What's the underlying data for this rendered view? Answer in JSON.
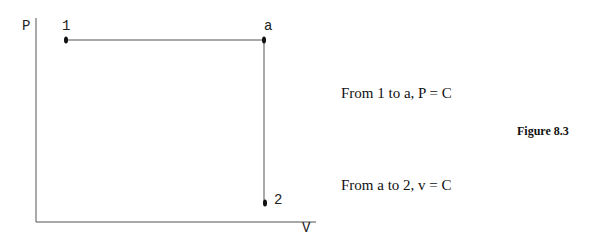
{
  "diagram": {
    "type": "P-v process diagram",
    "axes": {
      "y_label": "P",
      "x_label": "V"
    },
    "points": [
      {
        "label": "1",
        "x": 66,
        "y": 40
      },
      {
        "label": "a",
        "x": 264,
        "y": 40
      },
      {
        "label": "2",
        "x": 264,
        "y": 203
      }
    ],
    "processes": [
      {
        "from": "1",
        "to": "a",
        "description": "From 1 to a, P = C"
      },
      {
        "from": "a",
        "to": "2",
        "description": "From a to 2, v = C"
      }
    ],
    "caption": "Figure 8.3"
  }
}
